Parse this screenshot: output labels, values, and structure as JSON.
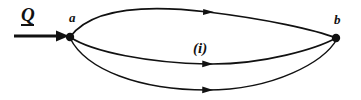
{
  "figure": {
    "type": "circuit-graph-diagram",
    "background_color": "#ffffff",
    "ink_color": "#111111",
    "nodes": [
      {
        "id": "a",
        "label": "a",
        "x": 70,
        "y": 37,
        "radius": 4.2
      },
      {
        "id": "b",
        "label": "b",
        "x": 336,
        "y": 38,
        "radius": 4.2
      }
    ],
    "branches": [
      {
        "id": "top-branch",
        "from": "a",
        "to": "b",
        "arrow_at_x": 208,
        "arrow_at_y": 13,
        "direction": "right"
      },
      {
        "id": "middle-branch",
        "from": "a",
        "to": "b",
        "label": "(i)",
        "arrow_at_x": 207,
        "arrow_at_y": 64,
        "direction": "right"
      },
      {
        "id": "bottom-branch",
        "from": "a",
        "to": "b",
        "arrow_at_x": 207,
        "arrow_at_y": 90,
        "direction": "right"
      }
    ],
    "source_arrow": {
      "id": "Q-arrow",
      "label": "Q",
      "label_underlined": true,
      "from_x": 14,
      "to_x": 67,
      "y": 36,
      "direction": "right"
    },
    "labels": {
      "source": "Q",
      "node_a": "a",
      "node_b": "b",
      "middle_branch": "(i)"
    }
  }
}
